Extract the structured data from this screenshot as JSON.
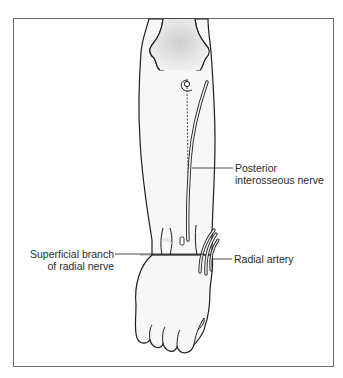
{
  "diagram": {
    "labels": {
      "posterior_interosseous_line1": "Posterior",
      "posterior_interosseous_line2": "interosseous nerve",
      "superficial_branch_line1": "Superficial branch",
      "superficial_branch_line2": "of radial nerve",
      "radial_artery": "Radial artery"
    },
    "colors": {
      "outline": "#1e1e1e",
      "frame": "#6b6b6b",
      "bone_shade": "#d8d8d8",
      "skin": "#f6f6f6",
      "text": "#2a2a2a"
    }
  }
}
